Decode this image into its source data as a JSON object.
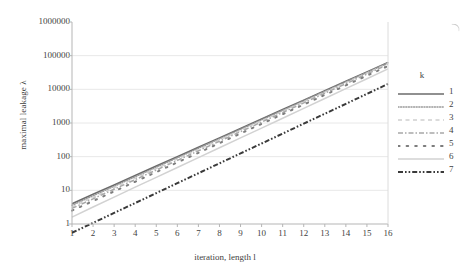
{
  "chart_data": {
    "type": "line",
    "title": "",
    "xlabel": "iteration, length l",
    "ylabel": "maximal leakage λ",
    "yscale": "log",
    "ylim": [
      1,
      1000000
    ],
    "xlim": [
      1,
      16
    ],
    "grid": true,
    "grid_axis": "y",
    "legend_position": "right",
    "legend_title": "k",
    "x": [
      1,
      2,
      3,
      4,
      5,
      6,
      7,
      8,
      9,
      10,
      11,
      12,
      13,
      14,
      15,
      16
    ],
    "xticklabels": [
      "1",
      "2",
      "3",
      "4",
      "5",
      "6",
      "7",
      "8",
      "9",
      "10",
      "11",
      "12",
      "13",
      "14",
      "15",
      "16"
    ],
    "yticklabels": [
      "1",
      "10",
      "100",
      "1000",
      "10000",
      "100000",
      "1000000"
    ],
    "ytickvalues": [
      1,
      10,
      100,
      1000,
      10000,
      100000,
      1000000
    ],
    "series": [
      {
        "name": "1",
        "style": "solid",
        "color": "#6b6b6b",
        "width": 1.6,
        "values": [
          4.0,
          7.6,
          14.5,
          27.6,
          52.5,
          100,
          190,
          362,
          689,
          1313,
          2500,
          4762,
          9070,
          17274,
          32903,
          62670
        ]
      },
      {
        "name": "2",
        "style": "fine-dotted",
        "color": "#9a9a9a",
        "width": 1.5,
        "values": [
          3.6,
          6.9,
          13.2,
          25.3,
          48.4,
          92.6,
          177,
          339,
          649,
          1242,
          2377,
          4549,
          8706,
          16662,
          31889,
          61026
        ]
      },
      {
        "name": "3",
        "style": "light-dashed",
        "color": "#cfcfcf",
        "width": 1.4,
        "values": [
          3.2,
          6.2,
          11.9,
          22.9,
          44.0,
          84.6,
          162,
          313,
          601,
          1156,
          2222,
          4273,
          8216,
          15800,
          30380,
          58420
        ]
      },
      {
        "name": "4",
        "style": "dash-dot",
        "color": "#a8a8a8",
        "width": 1.5,
        "values": [
          2.9,
          5.6,
          10.8,
          20.8,
          40.1,
          77.3,
          149,
          287,
          553,
          1066,
          2055,
          3962,
          7637,
          14720,
          28370,
          54680
        ]
      },
      {
        "name": "5",
        "style": "sparse-dots",
        "color": "#7d7d7d",
        "width": 2.0,
        "values": [
          2.5,
          4.8,
          9.3,
          18.0,
          34.8,
          67.3,
          130,
          252,
          487,
          942,
          1821,
          3520,
          6804,
          13150,
          25420,
          49130
        ]
      },
      {
        "name": "6",
        "style": "light-solid",
        "color": "#d2d2d2",
        "width": 1.5,
        "values": [
          1.6,
          3.2,
          6.3,
          12.4,
          24.3,
          47.7,
          93.6,
          184,
          360,
          707,
          1387,
          2722,
          5341,
          10480,
          20570,
          40360
        ]
      },
      {
        "name": "7",
        "style": "dash-dot-dot",
        "color": "#3a3a3a",
        "width": 2.0,
        "values": [
          0.55,
          1.08,
          2.13,
          4.2,
          8.28,
          16.3,
          32.2,
          63.4,
          125,
          246,
          485,
          956,
          1884,
          3713,
          7318,
          14420
        ]
      }
    ]
  }
}
